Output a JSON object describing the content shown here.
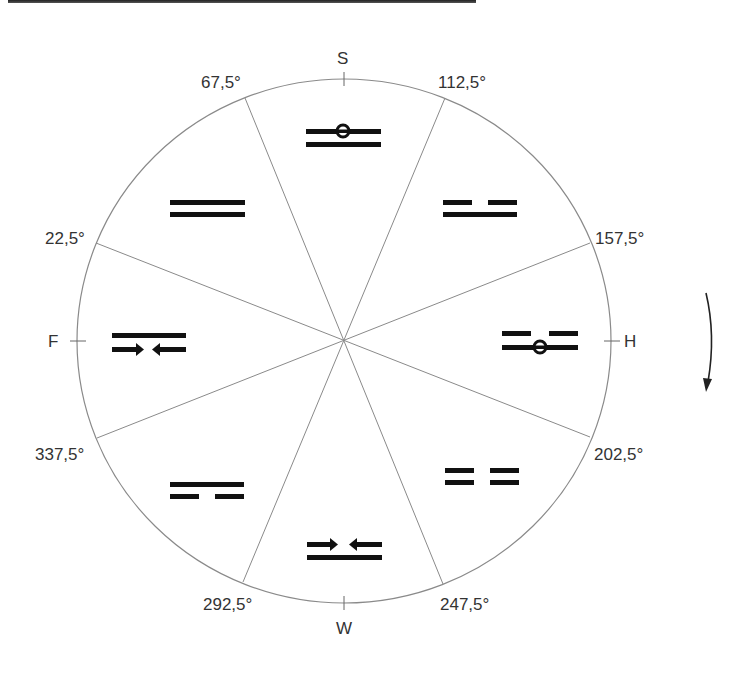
{
  "diagram": {
    "directions": {
      "top": "S",
      "right": "H",
      "bottom": "W",
      "left": "F"
    },
    "angles": {
      "a67": "67,5°",
      "a112": "112,5°",
      "a157": "157,5°",
      "a202": "202,5°",
      "a247": "247,5°",
      "a292": "292,5°",
      "a337": "337,5°",
      "a22": "22,5°"
    },
    "sectors": [
      {
        "position": "top",
        "direction": "S",
        "top_line": "solid-with-circle",
        "bottom_line": "solid"
      },
      {
        "position": "upper-right",
        "top_line": "broken",
        "bottom_line": "solid"
      },
      {
        "position": "right",
        "direction": "H",
        "top_line": "broken",
        "bottom_line": "solid-with-circle"
      },
      {
        "position": "lower-right",
        "top_line": "broken",
        "bottom_line": "broken"
      },
      {
        "position": "bottom",
        "direction": "W",
        "top_line": "arrows-inward",
        "bottom_line": "solid"
      },
      {
        "position": "lower-left",
        "top_line": "solid",
        "bottom_line": "broken"
      },
      {
        "position": "left",
        "direction": "F",
        "top_line": "solid",
        "bottom_line": "arrows-inward"
      },
      {
        "position": "upper-left",
        "top_line": "solid",
        "bottom_line": "solid"
      }
    ],
    "rotation_indicator": "clockwise-arrow-down",
    "colors": {
      "outline": "#8a8a8a",
      "symbol": "#111111",
      "text": "#333333"
    }
  }
}
